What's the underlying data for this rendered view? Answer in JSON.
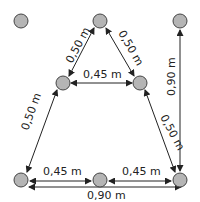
{
  "diagram": {
    "title": "",
    "colors": {
      "node_fill": "#b5b5b5",
      "node_stroke": "#444444",
      "line": "#222222",
      "text": "#222222"
    },
    "nodes": [
      {
        "id": "isolated-top-left",
        "x": 21,
        "y": 21
      },
      {
        "id": "top-middle",
        "x": 100,
        "y": 21
      },
      {
        "id": "top-right",
        "x": 180,
        "y": 21
      },
      {
        "id": "middle-left",
        "x": 63,
        "y": 83
      },
      {
        "id": "middle-right",
        "x": 140,
        "y": 83
      },
      {
        "id": "bottom-left",
        "x": 21,
        "y": 180
      },
      {
        "id": "bottom-middle",
        "x": 100,
        "y": 180
      },
      {
        "id": "bottom-right",
        "x": 180,
        "y": 180
      }
    ],
    "dimensions": {
      "top_to_midleft": "0,50 m",
      "top_to_midright": "0,50 m",
      "mid_horizontal": "0,45 m",
      "right_vertical": "0,90 m",
      "midleft_to_bottomleft": "0,50 m",
      "midright_to_bottomright": "0,50 m",
      "bottom_left_segment": "0,45 m",
      "bottom_right_segment": "0,45 m",
      "bottom_total": "0,90 m"
    }
  }
}
